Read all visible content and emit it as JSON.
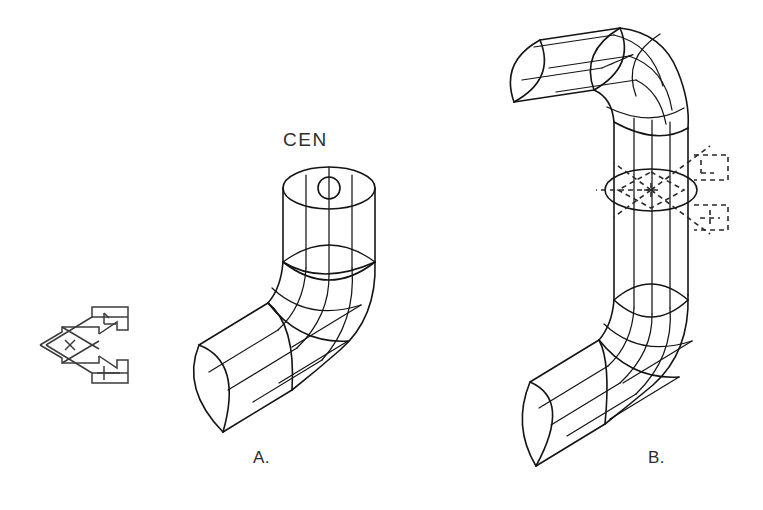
{
  "drawing": {
    "title": "Isometric wireframe pipe elbow assembly",
    "background_color": "#ffffff",
    "line_color": "#141414",
    "cursor_color": "#2a2a2a",
    "ucs_icon_color": "#3b3b3b"
  },
  "annotations": {
    "osnap_label": "CEN",
    "osnap_label_meaning": "center-object-snap-marker"
  },
  "captions": {
    "figure_a": "A.",
    "figure_b": "B."
  },
  "figures": [
    {
      "id": "figure-a",
      "caption": "A.",
      "description": "Single 90 degree pipe elbow with vertical riser, center osnap marker shown on top circular face",
      "parts": [
        "vertical-cylinder",
        "elbow-bend",
        "angled-cylinder"
      ],
      "markers": [
        "center-snap-circle"
      ]
    },
    {
      "id": "figure-b",
      "caption": "B.",
      "description": "Double pipe elbow forming a U/J shape with upper horizontal cylinder, long vertical run and lower angled cylinder",
      "parts": [
        "upper-elbow",
        "upper-horizontal-cylinder",
        "long-vertical-cylinder",
        "lower-elbow",
        "lower-angled-cylinder"
      ],
      "markers": [
        "crosshair-cursor",
        "aperture-box",
        "grip-bracket-upper",
        "grip-bracket-lower",
        "mid-ellipse"
      ]
    }
  ],
  "ucs_icon": {
    "name": "isometric-crosshair-ucs-icon",
    "axis_glyphs": [
      "Y",
      "X"
    ],
    "center_glyph": "x"
  }
}
